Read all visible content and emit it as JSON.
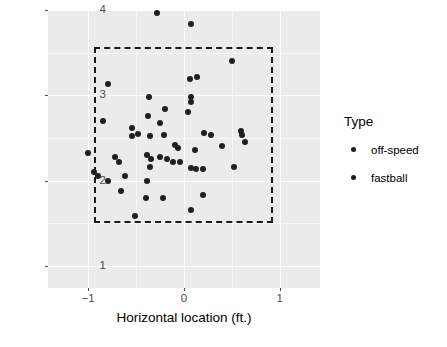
{
  "chart_data": {
    "type": "scatter",
    "title": "",
    "xlabel": "Horizontal location (ft.)",
    "ylabel": "Vertical location (ft.)",
    "xlim": [
      -1.42,
      1.42
    ],
    "ylim": [
      0.74,
      4.0
    ],
    "xticks": [
      -1,
      0,
      1
    ],
    "xtick_labels": [
      "−1",
      "0",
      "1"
    ],
    "yticks": [
      1,
      2,
      3,
      4
    ],
    "ytick_labels": [
      "1",
      "2",
      "3",
      "4"
    ],
    "grid": true,
    "grid_color": "#ffffff",
    "panel_background": "#ebebeb",
    "point_color": "#1f1f1f",
    "legend_position": "right",
    "annotations": [
      {
        "name": "strike-zone",
        "shape": "rectangle",
        "style": "dashed",
        "x0": -0.94,
        "x1": 0.93,
        "y0": 1.5,
        "y1": 3.57
      }
    ],
    "series": [
      {
        "name": "off-speed",
        "marker": "circle",
        "color": "#1f1f1f",
        "points": [
          [
            -0.28,
            3.97
          ],
          [
            0.07,
            3.84
          ],
          [
            0.5,
            3.4
          ],
          [
            -0.79,
            3.13
          ],
          [
            0.06,
            3.19
          ],
          [
            0.14,
            3.21
          ],
          [
            -0.37,
            2.98
          ],
          [
            0.07,
            2.98
          ],
          [
            0.07,
            2.92
          ],
          [
            -0.2,
            2.84
          ],
          [
            -0.38,
            2.76
          ],
          [
            0.04,
            2.8
          ],
          [
            -0.25,
            2.67
          ],
          [
            -0.85,
            2.7
          ],
          [
            -0.54,
            2.62
          ],
          [
            -0.54,
            2.52
          ],
          [
            -0.48,
            2.55
          ],
          [
            -0.36,
            2.52
          ],
          [
            -0.21,
            2.54
          ],
          [
            0.21,
            2.56
          ],
          [
            0.28,
            2.54
          ],
          [
            0.6,
            2.58
          ],
          [
            0.61,
            2.53
          ],
          [
            0.64,
            2.45
          ]
        ]
      },
      {
        "name": "fastball",
        "marker": "circle",
        "color": "#1f1f1f",
        "points": [
          [
            -0.09,
            2.42
          ],
          [
            -0.06,
            2.38
          ],
          [
            0.12,
            2.36
          ],
          [
            0.4,
            2.4
          ],
          [
            -1.0,
            2.32
          ],
          [
            -0.39,
            2.3
          ],
          [
            -0.34,
            2.25
          ],
          [
            -0.25,
            2.28
          ],
          [
            -0.18,
            2.25
          ],
          [
            -0.11,
            2.22
          ],
          [
            -0.04,
            2.22
          ],
          [
            -0.68,
            2.22
          ],
          [
            -0.72,
            2.28
          ],
          [
            -0.36,
            2.16
          ],
          [
            0.07,
            2.15
          ],
          [
            0.13,
            2.14
          ],
          [
            0.2,
            2.13
          ],
          [
            0.52,
            2.16
          ],
          [
            -0.94,
            2.1
          ],
          [
            -0.9,
            2.05
          ],
          [
            -0.79,
            2.0
          ],
          [
            -0.62,
            2.05
          ],
          [
            -0.39,
            2.0
          ],
          [
            -0.66,
            1.88
          ],
          [
            -0.4,
            1.8
          ],
          [
            -0.22,
            1.8
          ],
          [
            0.2,
            1.83
          ],
          [
            0.07,
            1.66
          ],
          [
            -0.51,
            1.59
          ]
        ]
      }
    ]
  },
  "legend": {
    "title": "Type",
    "entries": [
      {
        "label": "off-speed",
        "key_icon": "dot-marker"
      },
      {
        "label": "fastball",
        "key_icon": "dot-marker"
      }
    ]
  }
}
